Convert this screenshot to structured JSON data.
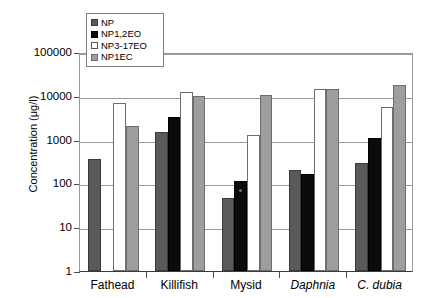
{
  "chart_data": {
    "type": "bar",
    "title": "",
    "xlabel": "",
    "ylabel": "Concentration (μg/l)",
    "yscale": "log",
    "ylim": [
      1,
      100000
    ],
    "ytick_labels": [
      "100000",
      "10000",
      "1000",
      "100",
      "10",
      "1"
    ],
    "ytick_values": [
      100000,
      10000,
      1000,
      100,
      10,
      1
    ],
    "grid": true,
    "legend_position": "top-left",
    "categories": [
      "Fathead",
      "Killifish",
      "Mysid",
      "Daphnia",
      "C. dubia"
    ],
    "categories_italic": [
      false,
      false,
      false,
      true,
      true
    ],
    "series": [
      {
        "name": "NP",
        "color": "#5a5a5a",
        "values": [
          370,
          1500,
          46,
          205,
          300
        ]
      },
      {
        "name": "NP1,2EO",
        "color": "#0b0b0b",
        "values": [
          null,
          3200,
          115,
          160,
          1100
        ]
      },
      {
        "name": "NP3-17EO",
        "color": "#ffffff",
        "values": [
          6800,
          12000,
          1300,
          14000,
          5500
        ]
      },
      {
        "name": "NP1EC",
        "color": "#9e9e9e",
        "values": [
          2100,
          10000,
          10300,
          14500,
          18000
        ]
      }
    ]
  },
  "legend": {
    "items": [
      {
        "label": "NP",
        "swatch": "np"
      },
      {
        "label": "NP1,2EO",
        "swatch": "np12eo"
      },
      {
        "label": "NP3-17EO",
        "swatch": "np317eo"
      },
      {
        "label": "NP1EC",
        "swatch": "np1ec"
      }
    ]
  },
  "axes": {
    "y_title": "Concentration (μg/l)"
  }
}
